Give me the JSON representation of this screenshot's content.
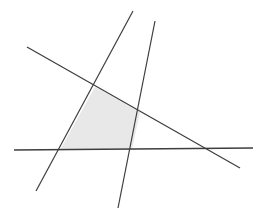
{
  "figure": {
    "background_color": "#ffffff",
    "width": 260,
    "height": 222
  },
  "chart_data": {
    "type": "scatter",
    "subtitle": "",
    "xlabel": "",
    "ylabel": "",
    "xlim": [
      0,
      260
    ],
    "ylim": [
      222,
      0
    ],
    "grid": false,
    "legend": "none",
    "axes_visible": false,
    "tick_labels_x": [],
    "tick_labels_y": [],
    "annotations": [],
    "line_color": "#3d3d3d",
    "line_width": 1.2,
    "region_fill_color": "#e8e8e8",
    "region_stroke": "none",
    "series": [
      {
        "name": "descending-diagonal",
        "type": "line",
        "color": "#3d3d3d",
        "width": 1.2,
        "x": [
          27,
          240
        ],
        "y": [
          47,
          168
        ]
      },
      {
        "name": "steep-line-left",
        "type": "line",
        "color": "#3d3d3d",
        "width": 1.2,
        "x": [
          133,
          36
        ],
        "y": [
          11,
          191
        ]
      },
      {
        "name": "steep-line-right",
        "type": "line",
        "color": "#3d3d3d",
        "width": 1.2,
        "x": [
          155,
          118
        ],
        "y": [
          21,
          208
        ]
      },
      {
        "name": "horizontal-line",
        "type": "line",
        "color": "#3d3d3d",
        "width": 1.4,
        "x": [
          14,
          253
        ],
        "y": [
          150,
          148
        ]
      }
    ],
    "regions": [
      {
        "name": "shaded-quadrilateral",
        "fill": "#e8e8e8",
        "vertices_x": [
          95,
          140,
          132,
          60
        ],
        "vertices_y": [
          87,
          112,
          149,
          150
        ],
        "vertex_labels": [
          "top-left",
          "right",
          "bottom-right",
          "bottom-left"
        ]
      }
    ],
    "intersections": [
      {
        "name": "descending-x-steepleft",
        "x": 95,
        "y": 87
      },
      {
        "name": "descending-x-steepright",
        "x": 140,
        "y": 112
      },
      {
        "name": "horizontal-x-steepright",
        "x": 132,
        "y": 149
      },
      {
        "name": "horizontal-x-steepleft",
        "x": 60,
        "y": 150
      },
      {
        "name": "horizontal-x-descending",
        "x": 210,
        "y": 150
      },
      {
        "name": "steepleft-x-steepright",
        "x": 149,
        "y": 42
      }
    ]
  }
}
